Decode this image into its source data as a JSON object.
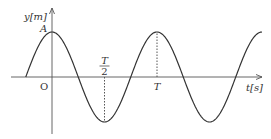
{
  "chart_data": {
    "type": "line",
    "title": "",
    "xlabel": "t[s]",
    "ylabel": "y[m]",
    "origin_label": "O",
    "amplitude_label": "A",
    "function": "y = A cos(2πt/T)",
    "series": [
      {
        "name": "displacement",
        "amplitude": 1,
        "period": 1,
        "phase": "cosine",
        "t_range": [
          -0.5,
          2.0
        ]
      }
    ],
    "x_ticks": [
      {
        "value": 0.5,
        "label_num": "T",
        "label_den": "2",
        "guide": "dotted"
      },
      {
        "value": 1.0,
        "label": "T",
        "guide": "dotted"
      }
    ],
    "xlim": [
      -0.8,
      2.05
    ],
    "ylim": [
      -1.15,
      1.3
    ],
    "grid": false,
    "colors": {
      "curve": "#333333",
      "axis": "#555555",
      "guide": "#555555"
    }
  }
}
